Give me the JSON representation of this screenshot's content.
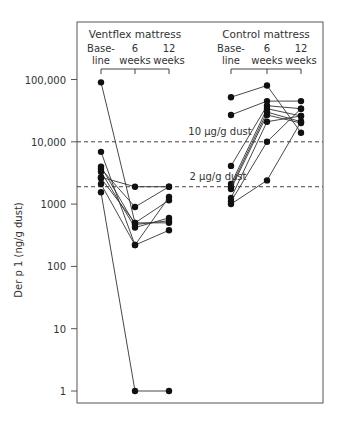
{
  "chart_data": {
    "type": "line",
    "title": "",
    "ylabel": "Der p 1 (ng/g dust)",
    "xlabel": "",
    "yscale": "log",
    "ylim": [
      1,
      100000
    ],
    "yticks": [
      {
        "value": 100000,
        "label": "100,000"
      },
      {
        "value": 10000,
        "label": "10,000"
      },
      {
        "value": 1000,
        "label": "1000"
      },
      {
        "value": 100,
        "label": "100"
      },
      {
        "value": 10,
        "label": "10"
      },
      {
        "value": 1,
        "label": "1"
      }
    ],
    "reference_lines": [
      {
        "value": 10000,
        "label": "10 µg/g dust",
        "style": "dashed"
      },
      {
        "value": 1900,
        "label": "2 µg/g dust",
        "style": "dashed"
      }
    ],
    "groups": [
      {
        "name": "Ventflex mattress",
        "timepoints": [
          {
            "label_line1": "Base-",
            "label_line2": "line"
          },
          {
            "label_line1": "6",
            "label_line2": "weeks"
          },
          {
            "label_line1": "12",
            "label_line2": "weeks"
          }
        ],
        "subjects": [
          [
            90000,
            500,
            1150
          ],
          [
            6900,
            220,
            1300
          ],
          [
            4000,
            470,
            540
          ],
          [
            3700,
            900,
            1900
          ],
          [
            3300,
            420,
            600
          ],
          [
            2700,
            1900,
            1900
          ],
          [
            2600,
            500,
            500
          ],
          [
            2100,
            220,
            380
          ],
          [
            1550,
            1,
            1
          ]
        ]
      },
      {
        "name": "Control mattress",
        "timepoints": [
          {
            "label_line1": "Base-",
            "label_line2": "line"
          },
          {
            "label_line1": "6",
            "label_line2": "weeks"
          },
          {
            "label_line1": "12",
            "label_line2": "weeks"
          }
        ],
        "subjects": [
          [
            52000,
            80000,
            14000
          ],
          [
            27000,
            45000,
            45000
          ],
          [
            4100,
            38000,
            34000
          ],
          [
            2100,
            34000,
            26000
          ],
          [
            1900,
            30000,
            21000
          ],
          [
            1750,
            27000,
            20000
          ],
          [
            1250,
            21000,
            26000
          ],
          [
            1100,
            10000,
            34000
          ],
          [
            1000,
            2400,
            21000
          ]
        ]
      }
    ],
    "grid": false,
    "legend": "none"
  }
}
